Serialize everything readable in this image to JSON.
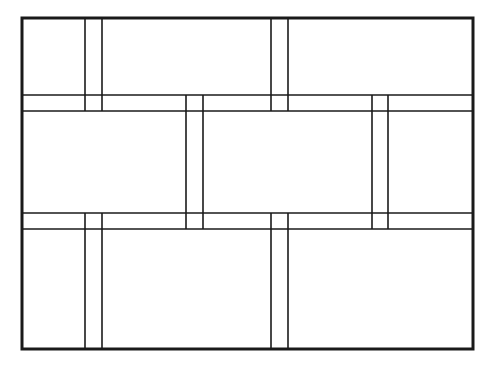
{
  "diagram": {
    "colors": {
      "background": "#ffffff",
      "stroke": "#1a1a1a"
    },
    "outer_frame": {
      "x": 22,
      "y": 18,
      "width": 451,
      "height": 331,
      "stroke_width": 3
    },
    "horizontal_bands": [
      {
        "y1": 95,
        "y2": 111
      },
      {
        "y1": 213,
        "y2": 229
      }
    ],
    "rows": [
      {
        "name": "top-row",
        "y_top": 18,
        "y_bottom": 111,
        "vertical_joints": [
          {
            "x1": 85,
            "x2": 102
          },
          {
            "x1": 271,
            "x2": 288
          }
        ]
      },
      {
        "name": "middle-row",
        "y_top": 95,
        "y_bottom": 229,
        "vertical_joints": [
          {
            "x1": 186,
            "x2": 203
          },
          {
            "x1": 372,
            "x2": 388
          }
        ]
      },
      {
        "name": "bottom-row",
        "y_top": 213,
        "y_bottom": 349,
        "vertical_joints": [
          {
            "x1": 85,
            "x2": 102
          },
          {
            "x1": 271,
            "x2": 288
          }
        ]
      }
    ]
  }
}
